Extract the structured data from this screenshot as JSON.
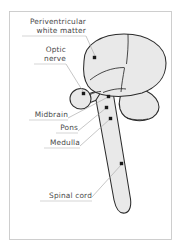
{
  "figure": {
    "frame": {
      "x": 9,
      "y": 11,
      "width": 163,
      "height": 229
    },
    "colors": {
      "background": "#ffffff",
      "structure_fill": "#e9e9e9",
      "structure_outline": "#2b2b2b",
      "label_text": "#4a4a4a",
      "leader_line": "#a8a8a8",
      "marker_dot": "#1a1a1a",
      "frame_border": "#c9c9c9"
    }
  },
  "labels": [
    {
      "id": "periventricular-white-matter",
      "lines": [
        "Periventricular",
        "white matter"
      ],
      "line1": "Periventricular",
      "line2": "white matter",
      "text_anchor_x": 86,
      "line1_y": 24,
      "line2_y": 33,
      "underline_x1": 22,
      "underline_x2": 86,
      "underline_y": 36,
      "leader": "M 86 36 L 95 56",
      "marker": {
        "x": 94.5,
        "y": 57.5
      }
    },
    {
      "id": "optic-nerve",
      "lines": [
        "Optic",
        "nerve"
      ],
      "line1": "Optic",
      "line2": "nerve",
      "text_anchor_x": 66,
      "line1_y": 52,
      "line2_y": 61,
      "underline_x1": 34,
      "underline_x2": 66,
      "underline_y": 64,
      "leader": "M 66 64 L 84 93",
      "marker": {
        "x": 83.5,
        "y": 93.5
      }
    },
    {
      "id": "midbrain",
      "lines": [
        "Midbrain"
      ],
      "line1": "Midbrain",
      "text_anchor_x": 68,
      "line1_y": 117,
      "underline_x1": 29,
      "underline_x2": 68,
      "underline_y": 120,
      "leader": "M 68 118 L 108 97",
      "marker": {
        "x": 108.5,
        "y": 96.5
      }
    },
    {
      "id": "pons",
      "lines": [
        "Pons"
      ],
      "line1": "Pons",
      "text_anchor_x": 78,
      "line1_y": 130,
      "underline_x1": 56,
      "underline_x2": 78,
      "underline_y": 133,
      "leader": "M 78 131 L 106 108",
      "marker": {
        "x": 106.5,
        "y": 107.5
      }
    },
    {
      "id": "medulla",
      "lines": [
        "Medulla"
      ],
      "line1": "Medulla",
      "text_anchor_x": 80,
      "line1_y": 145,
      "underline_x1": 44,
      "underline_x2": 80,
      "underline_y": 148,
      "leader": "M 80 146 L 110 119",
      "marker": {
        "x": 110.5,
        "y": 118.5
      }
    },
    {
      "id": "spinal-cord",
      "lines": [
        "Spinal cord"
      ],
      "line1": "Spinal cord",
      "text_anchor_x": 92,
      "line1_y": 198,
      "underline_x1": 40,
      "underline_x2": 92,
      "underline_y": 201,
      "leader": "M 92 197 L 121 165",
      "marker": {
        "x": 121.5,
        "y": 163.5
      }
    }
  ],
  "structures": [
    {
      "id": "cerebrum",
      "name": "Cerebrum",
      "path": "M 84 61 C 84 44 102 34 124 34 C 148 34 166 46 166 63 C 166 78 156 88 142 93 C 132 96 120 97 110 96 C 100 95 92 92 88 86 C 84 80 83 70 84 61 Z"
    },
    {
      "id": "cerebellum",
      "name": "Cerebellum",
      "path": "M 126 89 C 136 88 146 90 152 95 C 159 100 161 108 157 114 C 153 119 145 121 137 120 C 130 119 124 115 121 109 C 118 103 119 94 126 89 Z"
    },
    {
      "id": "optic-nerve-shape",
      "name": "Optic nerve and eye",
      "path": "M 70 99 C 70 93 75 89 81 89 C 86 89 90 93 90 99 C 90 104 86 108 81 108 C 75 108 70 104 70 99 Z"
    },
    {
      "id": "optic-tract",
      "name": "Optic tract connector",
      "path": "M 88 94 L 100 90 L 102 98 L 89 103 Z"
    },
    {
      "id": "brainstem-spinal-cord",
      "name": "Brainstem and spinal cord",
      "path": "M 101 92 L 113 92 L 130 196 C 132 205 130 212 125 213 C 120 214 116 209 114 200 L 96 100 Z"
    }
  ],
  "inner_lines": [
    {
      "id": "central-sulcus",
      "path": "M 128 34 C 128 45 127 55 126 64"
    },
    {
      "id": "corpus-callosum-line",
      "path": "M 91 79 C 100 72 112 68 124 68"
    },
    {
      "id": "cerebellum-boundary",
      "path": "M 124 70 C 122 78 121 85 121 92"
    },
    {
      "id": "tentorium-line",
      "path": "M 104 92 C 112 89 120 88 126 89"
    }
  ]
}
